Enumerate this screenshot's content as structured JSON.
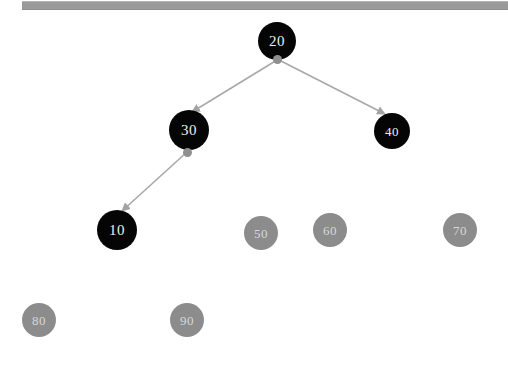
{
  "app": {
    "title": "Binary Search Tree Visualization",
    "background_color": "#ffffff"
  },
  "toolbar": {
    "name": "top-toolbar-strip",
    "color": "#9a9a9a"
  },
  "colors": {
    "filled_node": "#050505",
    "filled_node_text": "#efefef",
    "empty_node": "#8c8c8c",
    "empty_node_text": "#d8d8d8",
    "edge": "#a8a8a8",
    "anchor_dot": "#8f8f8f"
  },
  "tree": {
    "type": "binary-search-tree",
    "nodes": [
      {
        "id": "node-20",
        "label": "20",
        "cx": 277,
        "cy": 41,
        "r": 19,
        "state": "filled",
        "level": 0
      },
      {
        "id": "node-30",
        "label": "30",
        "cx": 189,
        "cy": 130,
        "r": 20,
        "state": "filled",
        "level": 1
      },
      {
        "id": "node-40",
        "label": "40",
        "cx": 392,
        "cy": 131,
        "r": 18,
        "state": "filled",
        "level": 1
      },
      {
        "id": "node-10",
        "label": "10",
        "cx": 117,
        "cy": 230,
        "r": 20,
        "state": "filled",
        "level": 2
      },
      {
        "id": "node-50",
        "label": "50",
        "cx": 261,
        "cy": 233,
        "r": 17,
        "state": "empty",
        "level": 2
      },
      {
        "id": "node-60",
        "label": "60",
        "cx": 330,
        "cy": 230,
        "r": 17,
        "state": "empty",
        "level": 2
      },
      {
        "id": "node-70",
        "label": "70",
        "cx": 460,
        "cy": 230,
        "r": 17,
        "state": "empty",
        "level": 2
      },
      {
        "id": "node-80",
        "label": "80",
        "cx": 39,
        "cy": 320,
        "r": 17,
        "state": "empty",
        "level": 3
      },
      {
        "id": "node-90",
        "label": "90",
        "cx": 187,
        "cy": 320,
        "r": 17,
        "state": "empty",
        "level": 3
      }
    ],
    "edges": [
      {
        "id": "edge-20-30",
        "from": "node-20",
        "to": "node-30",
        "x1": 277,
        "y1": 60,
        "x2": 192,
        "y2": 112,
        "directed": true
      },
      {
        "id": "edge-20-40",
        "from": "node-20",
        "to": "node-40",
        "x1": 279,
        "y1": 60,
        "x2": 385,
        "y2": 114,
        "directed": true
      },
      {
        "id": "edge-30-10",
        "from": "node-30",
        "to": "node-10",
        "x1": 187,
        "y1": 152,
        "x2": 122,
        "y2": 211,
        "directed": true
      }
    ],
    "anchor_dots": [
      {
        "id": "dot-20",
        "cx": 277,
        "cy": 59
      },
      {
        "id": "dot-30",
        "cx": 187,
        "cy": 152
      }
    ]
  }
}
